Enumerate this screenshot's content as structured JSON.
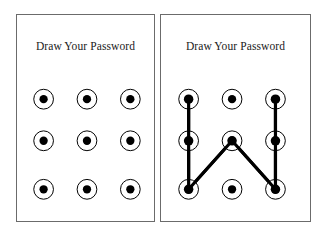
{
  "canvas": {
    "width": 327,
    "height": 244,
    "background_color": "#ffffff"
  },
  "style": {
    "panel_border_color": "#6b6b6b",
    "panel_fill_color": "#ffffff",
    "node_ring_color": "#000000",
    "node_dot_color": "#000000",
    "pattern_line_color": "#000000",
    "title_color": "#1a1a1a",
    "node_ring_radius": 10,
    "node_dot_radius": 4.2,
    "pattern_line_width": 3.2
  },
  "panels": [
    {
      "id": "empty-grid-panel",
      "title": "Draw Your Password",
      "rect": {
        "x": 16,
        "y": 14,
        "width": 139,
        "height": 208
      },
      "grid": {
        "rows": 3,
        "cols": 3,
        "col_x": [
          27,
          71,
          115
        ],
        "row_y": [
          85,
          127,
          176
        ],
        "node_labels": [
          [
            "top-left",
            "top-center",
            "top-right"
          ],
          [
            "middle-left",
            "middle-center",
            "middle-right"
          ],
          [
            "bottom-left",
            "bottom-center",
            "bottom-right"
          ]
        ]
      },
      "pattern": {
        "drawn": false,
        "sequence": [],
        "segments": []
      }
    },
    {
      "id": "pattern-grid-panel",
      "title": "Draw Your Password",
      "rect": {
        "x": 160,
        "y": 14,
        "width": 151,
        "height": 208
      },
      "grid": {
        "rows": 3,
        "cols": 3,
        "col_x": [
          28,
          72,
          116
        ],
        "row_y": [
          85,
          127,
          176
        ],
        "node_labels": [
          [
            "top-left",
            "top-center",
            "top-right"
          ],
          [
            "middle-left",
            "middle-center",
            "middle-right"
          ],
          [
            "bottom-left",
            "bottom-center",
            "bottom-right"
          ]
        ]
      },
      "pattern": {
        "drawn": true,
        "sequence": [
          "top-left",
          "middle-left",
          "bottom-left",
          "middle-center",
          "bottom-right",
          "middle-right",
          "top-right"
        ],
        "sequence_indices": [
          [
            0,
            0
          ],
          [
            1,
            0
          ],
          [
            2,
            0
          ],
          [
            1,
            1
          ],
          [
            2,
            2
          ],
          [
            1,
            2
          ],
          [
            0,
            2
          ]
        ],
        "segments": [
          {
            "from": [
              0,
              0
            ],
            "to": [
              1,
              0
            ]
          },
          {
            "from": [
              1,
              0
            ],
            "to": [
              2,
              0
            ]
          },
          {
            "from": [
              2,
              0
            ],
            "to": [
              1,
              1
            ]
          },
          {
            "from": [
              1,
              1
            ],
            "to": [
              2,
              2
            ]
          },
          {
            "from": [
              2,
              2
            ],
            "to": [
              1,
              2
            ]
          },
          {
            "from": [
              1,
              2
            ],
            "to": [
              0,
              2
            ]
          }
        ]
      }
    }
  ]
}
